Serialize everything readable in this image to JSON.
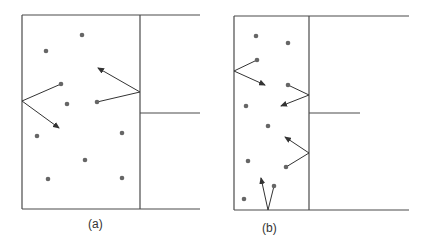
{
  "panels": [
    {
      "label": "(a)",
      "description": "Molecules in a box with a wide opening; reflections off walls",
      "box": {
        "left": 22,
        "right": 140,
        "top": 15,
        "bottom": 209
      },
      "outer_lines": [
        {
          "x1": 22,
          "y1": 15,
          "x2": 200,
          "y2": 15
        },
        {
          "x1": 22,
          "y1": 209,
          "x2": 200,
          "y2": 209
        },
        {
          "x1": 140,
          "y1": 113,
          "x2": 200,
          "y2": 113
        }
      ],
      "dots": [
        [
          82,
          35
        ],
        [
          46,
          51
        ],
        [
          61,
          84
        ],
        [
          67,
          104
        ],
        [
          97,
          102
        ],
        [
          37,
          136
        ],
        [
          122,
          133
        ],
        [
          85,
          160
        ],
        [
          48,
          179
        ],
        [
          122,
          178
        ]
      ],
      "rays": [
        {
          "x1": 22,
          "y1": 101,
          "x2": 61,
          "y2": 84,
          "arrow": false
        },
        {
          "x1": 22,
          "y1": 101,
          "x2": 59,
          "y2": 128,
          "arrow": true
        },
        {
          "x1": 140,
          "y1": 92,
          "x2": 97,
          "y2": 102,
          "arrow": false
        },
        {
          "x1": 140,
          "y1": 92,
          "x2": 98,
          "y2": 68,
          "arrow": true
        }
      ],
      "label_pos": {
        "x": 88,
        "y": 217
      }
    },
    {
      "label": "(b)",
      "description": "Molecules in a narrow box; reflections off walls",
      "box": {
        "left": 234,
        "right": 309,
        "top": 16,
        "bottom": 210
      },
      "outer_lines": [
        {
          "x1": 234,
          "y1": 16,
          "x2": 409,
          "y2": 16
        },
        {
          "x1": 234,
          "y1": 210,
          "x2": 409,
          "y2": 210
        },
        {
          "x1": 309,
          "y1": 113,
          "x2": 360,
          "y2": 113
        }
      ],
      "dots": [
        [
          256,
          36
        ],
        [
          288,
          43
        ],
        [
          257,
          60
        ],
        [
          288,
          85
        ],
        [
          246,
          106
        ],
        [
          268,
          126
        ],
        [
          248,
          161
        ],
        [
          286,
          167
        ],
        [
          274,
          186
        ],
        [
          244,
          199
        ]
      ],
      "rays": [
        {
          "x1": 234,
          "y1": 71,
          "x2": 257,
          "y2": 60,
          "arrow": false
        },
        {
          "x1": 234,
          "y1": 71,
          "x2": 265,
          "y2": 85,
          "arrow": true
        },
        {
          "x1": 309,
          "y1": 95,
          "x2": 288,
          "y2": 85,
          "arrow": false
        },
        {
          "x1": 309,
          "y1": 95,
          "x2": 281,
          "y2": 106,
          "arrow": true
        },
        {
          "x1": 309,
          "y1": 153,
          "x2": 286,
          "y2": 167,
          "arrow": false
        },
        {
          "x1": 309,
          "y1": 153,
          "x2": 285,
          "y2": 137,
          "arrow": true
        },
        {
          "x1": 268,
          "y1": 210,
          "x2": 274,
          "y2": 186,
          "arrow": false
        },
        {
          "x1": 268,
          "y1": 210,
          "x2": 261,
          "y2": 178,
          "arrow": true
        }
      ],
      "label_pos": {
        "x": 262,
        "y": 221
      }
    }
  ],
  "colors": {
    "line": "#4a4a4a",
    "dot": "#666666"
  }
}
